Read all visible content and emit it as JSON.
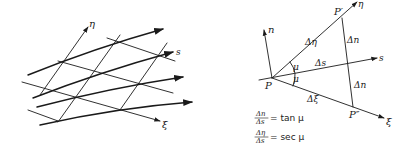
{
  "left_figure": {
    "labels": {
      "eta": "η",
      "s": "s",
      "xi": "ξ"
    }
  },
  "right_figure": {
    "labels": {
      "n": "n",
      "P": "P",
      "P_prime": "P′",
      "P_double_prime": "P″",
      "eta": "η",
      "s": "s",
      "xi": "ξ",
      "delta_eta": "Δη",
      "delta_s": "Δs",
      "delta_xi": "Δξ",
      "delta_n_upper": "Δn",
      "delta_n_lower": "Δn",
      "mu_upper": "μ",
      "mu_lower": "μ"
    },
    "equations": [
      {
        "numerator": "Δn",
        "denominator": "Δs",
        "rhs": "= tan μ"
      },
      {
        "numerator": "Δη",
        "denominator": "Δs",
        "rhs": "= sec μ"
      }
    ]
  }
}
